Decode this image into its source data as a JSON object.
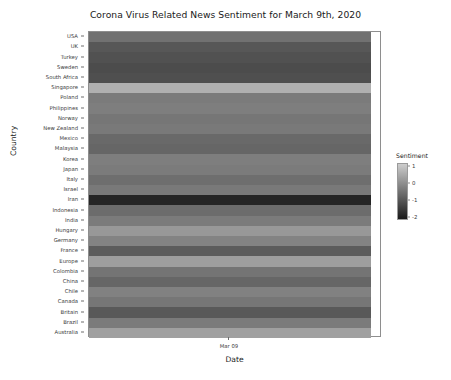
{
  "chart_data": {
    "type": "heatmap",
    "title": "Corona Virus Related News Sentiment for March 9th, 2020",
    "xlabel": "Date",
    "ylabel": "Country",
    "x": [
      "Mar 09"
    ],
    "categories": [
      "USA",
      "UK",
      "Turkey",
      "Sweden",
      "South Africa",
      "Singapore",
      "Poland",
      "Philippines",
      "Norway",
      "New Zealand",
      "Mexico",
      "Malaysia",
      "Korea",
      "Japan",
      "Italy",
      "Israel",
      "Iran",
      "Indonesia",
      "India",
      "Hungary",
      "Germany",
      "France",
      "Europe",
      "Colombia",
      "China",
      "Chile",
      "Canada",
      "Britain",
      "Brazil",
      "Australia"
    ],
    "values": [
      -0.55,
      -1.05,
      -1.15,
      -1.25,
      -1.2,
      0.65,
      -0.35,
      -0.3,
      -0.45,
      -0.4,
      -0.7,
      -0.75,
      -0.3,
      -0.35,
      -0.6,
      -0.4,
      -2.0,
      -0.65,
      -0.35,
      0.2,
      -0.2,
      -0.95,
      0.3,
      -0.5,
      -0.75,
      -0.25,
      -0.45,
      -1.0,
      -0.35,
      0.35
    ],
    "colorbar": {
      "label": "Sentiment",
      "ticks": [
        "1",
        "0",
        "-1",
        "-2"
      ],
      "tick_values": [
        1,
        0,
        -1,
        -2
      ],
      "vmin": -2.2,
      "vmax": 1.2,
      "colormap": "grayscale-light-high"
    },
    "grid": false,
    "legend_position": "right"
  }
}
